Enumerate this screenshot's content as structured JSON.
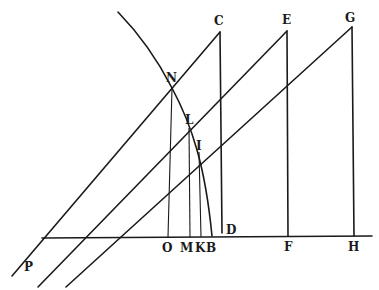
{
  "figure": {
    "type": "geometric-diagram",
    "labels": {
      "C": "C",
      "E": "E",
      "G": "G",
      "N": "N",
      "L": "L",
      "I": "I",
      "D": "D",
      "O": "O",
      "M": "M",
      "K": "K",
      "B": "B",
      "F": "F",
      "H": "H",
      "P": "P"
    },
    "colors": {
      "ink": "#1a1a1a",
      "paper": "#ffffff"
    }
  }
}
